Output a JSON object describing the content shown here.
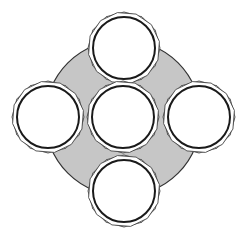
{
  "diagram": {
    "width": 251,
    "height": 233,
    "background": "#ffffff",
    "backdrop": {
      "cx": 123,
      "cy": 118,
      "r": 78,
      "fill": "#c6c6c6",
      "stroke": "#333333"
    },
    "circles": [
      {
        "id": "top",
        "cx": 124,
        "cy": 48,
        "r": 31
      },
      {
        "id": "left",
        "cx": 48,
        "cy": 117,
        "r": 31
      },
      {
        "id": "center",
        "cx": 123,
        "cy": 117,
        "r": 31
      },
      {
        "id": "right",
        "cx": 199,
        "cy": 117,
        "r": 31
      },
      {
        "id": "bottom",
        "cx": 124,
        "cy": 191,
        "r": 31
      }
    ],
    "circle_fill": "#ffffff",
    "circle_stroke": "#1a1a1a",
    "star_stroke": "#444444",
    "star_points": 12,
    "star_outer_offset": 5
  }
}
